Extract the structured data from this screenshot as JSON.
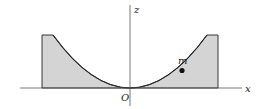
{
  "diagram": {
    "labels": {
      "x_axis": "x",
      "z_axis": "z",
      "origin": "O",
      "mass": "m"
    },
    "colors": {
      "fill": "#d4d4d4",
      "stroke": "#222222",
      "axis": "#555555",
      "background": "#ffffff"
    }
  }
}
